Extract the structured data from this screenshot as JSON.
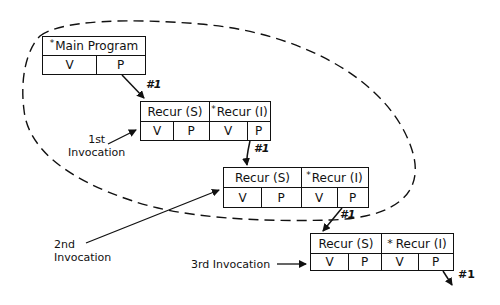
{
  "diagram": {
    "type": "recursion-activation-records",
    "main_program": {
      "title": "Main Program",
      "starred": true,
      "fields": [
        "V",
        "P"
      ]
    },
    "records": [
      {
        "id": "inv1",
        "left_title": "Recur (S)",
        "right_title": "Recur (I)",
        "right_starred": true,
        "fields": [
          "V",
          "P",
          "V",
          "P"
        ]
      },
      {
        "id": "inv2",
        "left_title": "Recur (S)",
        "right_title": "Recur (I)",
        "right_starred": true,
        "fields": [
          "V",
          "P",
          "V",
          "P"
        ]
      },
      {
        "id": "inv3",
        "left_title": "Recur (S)",
        "right_title": "Recur (I)",
        "right_starred": true,
        "fields": [
          "V",
          "P",
          "V",
          "P"
        ]
      }
    ],
    "arrow_labels": [
      "#1",
      "#1",
      "#1",
      "#1"
    ],
    "invocation_labels": {
      "first": [
        "1st",
        "Invocation"
      ],
      "second": [
        "2nd",
        "Invocation"
      ],
      "third": "3rd Invocation"
    },
    "star_symbol": "*",
    "line_color": "#111111"
  }
}
